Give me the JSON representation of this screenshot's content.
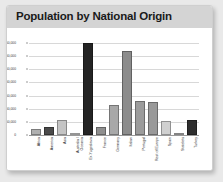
{
  "card": {
    "title": "Population by National Origin"
  },
  "chart_data": {
    "type": "bar",
    "title": "Population by National Origin",
    "xlabel": "",
    "ylabel": "",
    "ylim": [
      0,
      350000
    ],
    "grid": true,
    "legend": "none",
    "ytick_labels": [
      "350,000",
      "300,000",
      "250,000",
      "200,000",
      "150,000",
      "100,000",
      "50,000",
      "0"
    ],
    "ytick_values": [
      350000,
      300000,
      250000,
      200000,
      150000,
      100000,
      50000,
      0
    ],
    "categories": [
      "Africa",
      "America",
      "Asia",
      "Australia /\nOceania",
      "Ex-Yugoslavia",
      "France",
      "Germany",
      "Italian",
      "Portugal",
      "Rest of Europe",
      "Spain",
      "Statelets",
      "Turkey"
    ],
    "values": [
      22000,
      32000,
      57000,
      1500,
      350000,
      30000,
      113000,
      320000,
      128000,
      127000,
      55000,
      800,
      57000
    ],
    "bar_colors": [
      "#b0b0b0",
      "#4a4a4a",
      "#c4c4c4",
      "#d6d6d6",
      "#242424",
      "#8f8f8f",
      "#a8a8a8",
      "#8c8c8c",
      "#9c9c9c",
      "#999999",
      "#d0d0d0",
      "#bdbdbd",
      "#2e2e2e"
    ]
  }
}
